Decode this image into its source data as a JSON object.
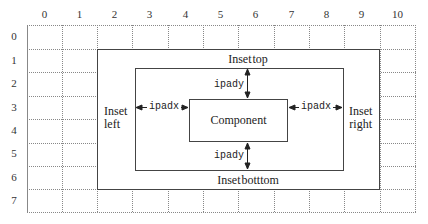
{
  "diagram": {
    "columns": [
      "0",
      "1",
      "2",
      "3",
      "4",
      "5",
      "6",
      "7",
      "8",
      "9",
      "10"
    ],
    "rows": [
      "0",
      "1",
      "2",
      "3",
      "4",
      "5",
      "6",
      "7"
    ],
    "outer_box": {
      "label_top": "Inset top",
      "label_bottom": "Inset botttom",
      "label_left_line1": "Inset",
      "label_left_line2": "left",
      "label_right_line1": "Inset",
      "label_right_line2": "right"
    },
    "inner_box": {
      "ipadx_left": "ipadx",
      "ipadx_right": "ipadx",
      "ipady_top": "ipady",
      "ipady_bottom": "ipady"
    },
    "component": {
      "label": "Component"
    },
    "colors": {
      "grid_line": "#888888",
      "box_line": "#444444",
      "text": "#222222",
      "background": "#ffffff"
    }
  }
}
